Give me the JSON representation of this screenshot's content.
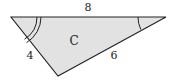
{
  "diagram": {
    "type": "triangle",
    "fill_color": "#e2e2e2",
    "stroke_color": "#222222",
    "center_label": "C",
    "sides": {
      "top": "8",
      "left": "4",
      "right": "6"
    },
    "angle_marks": {
      "left_vertex": "double-arc",
      "right_vertex": "single-arc"
    }
  }
}
